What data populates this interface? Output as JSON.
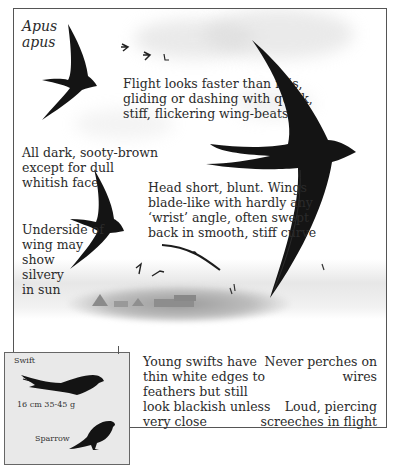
{
  "species": {
    "latin_name": "Apus\napus"
  },
  "notes": {
    "flight": "Flight looks faster than it is,\ngliding or dashing with quick,\nstiff, flickering wing-beats",
    "colour": "All dark, sooty-brown\nexcept for dull\nwhitish face",
    "head_wings": "Head short, blunt. Wings\nblade-like with hardly any\n‘wrist’ angle, often swept\nback in smooth, stiff curve",
    "underwing": "Underside of\nwing may\nshow\nsilvery\nin sun",
    "young": "Young swifts have\nthin white edges to\nfeathers but still\nlook blackish unless\nvery close",
    "perch": "Never perches on wires",
    "call": "Loud, piercing\nscreeches in flight"
  },
  "size_comparison": {
    "swift_label": "Swift",
    "measurements": "16 cm  35-45 g",
    "sparrow_label": "Sparrow"
  },
  "colors": {
    "ink": "#141414",
    "text": "#2b2b2b",
    "inset_bg": "#e9e9e9",
    "frame": "#555555"
  }
}
